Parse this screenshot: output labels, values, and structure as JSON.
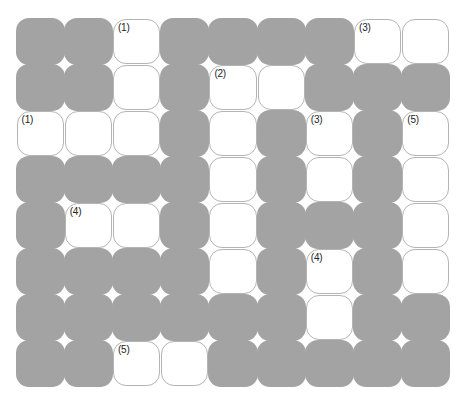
{
  "puzzle": {
    "rows": 8,
    "cols": 9,
    "colors": {
      "block": "#a3a3a3",
      "open": "#ffffff",
      "open_border": "#b4b4b4",
      "number_text": "#222222"
    },
    "grid": [
      [
        "B",
        "B",
        "O",
        "B",
        "B",
        "B",
        "B",
        "O",
        "O"
      ],
      [
        "B",
        "B",
        "O",
        "B",
        "O",
        "O",
        "B",
        "B",
        "B"
      ],
      [
        "O",
        "O",
        "O",
        "B",
        "O",
        "B",
        "O",
        "B",
        "O"
      ],
      [
        "B",
        "B",
        "B",
        "B",
        "O",
        "B",
        "O",
        "B",
        "O"
      ],
      [
        "B",
        "O",
        "O",
        "B",
        "O",
        "B",
        "B",
        "B",
        "O"
      ],
      [
        "B",
        "B",
        "B",
        "B",
        "O",
        "B",
        "O",
        "B",
        "O"
      ],
      [
        "B",
        "B",
        "B",
        "B",
        "B",
        "B",
        "O",
        "B",
        "B"
      ],
      [
        "B",
        "B",
        "O",
        "O",
        "B",
        "B",
        "B",
        "B",
        "B"
      ]
    ],
    "clue_numbers": [
      {
        "row": 0,
        "col": 2,
        "label": "(1)"
      },
      {
        "row": 0,
        "col": 7,
        "label": "(3)"
      },
      {
        "row": 1,
        "col": 4,
        "label": "(2)"
      },
      {
        "row": 2,
        "col": 0,
        "label": "(1)"
      },
      {
        "row": 2,
        "col": 6,
        "label": "(3)"
      },
      {
        "row": 2,
        "col": 8,
        "label": "(5)"
      },
      {
        "row": 4,
        "col": 1,
        "label": "(4)"
      },
      {
        "row": 5,
        "col": 6,
        "label": "(4)"
      },
      {
        "row": 7,
        "col": 2,
        "label": "(5)"
      }
    ],
    "labels": {
      "r0c2": "(1)",
      "r0c7": "(3)",
      "r1c4": "(2)",
      "r2c0": "(1)",
      "r2c6": "(3)",
      "r2c8": "(5)",
      "r4c1": "(4)",
      "r5c6": "(4)",
      "r7c2": "(5)"
    }
  }
}
